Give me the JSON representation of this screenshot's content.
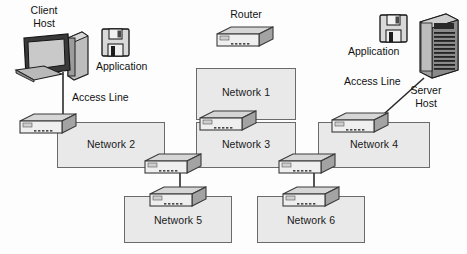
{
  "diagram": {
    "colors": {
      "box_fill": "#e9e9e9",
      "box_border": "#6a6a6a",
      "device_top": "#d6d6d6",
      "device_front": "#ededed",
      "device_side": "#a8a8a8",
      "line": "#2b2b2b",
      "text": "#111111"
    },
    "labels": {
      "client_host": "Client\nHost",
      "client_host_line1": "Client",
      "client_host_line2": "Host",
      "server_host_line1": "Server",
      "server_host_line2": "Host",
      "router": "Router",
      "application_left": "Application",
      "application_right": "Application",
      "access_line_left": "Access Line",
      "access_line_right": "Access Line"
    },
    "networks": [
      {
        "id": "network-1",
        "label": "Network 1",
        "x": 196,
        "y": 68,
        "w": 100,
        "h": 52
      },
      {
        "id": "network-2",
        "label": "Network 2",
        "x": 57,
        "y": 122,
        "w": 108,
        "h": 46
      },
      {
        "id": "network-3",
        "label": "Network 3",
        "x": 196,
        "y": 122,
        "w": 100,
        "h": 46
      },
      {
        "id": "network-4",
        "label": "Network 4",
        "x": 318,
        "y": 122,
        "w": 112,
        "h": 46
      },
      {
        "id": "network-5",
        "label": "Network 5",
        "x": 124,
        "y": 196,
        "w": 108,
        "h": 47
      },
      {
        "id": "network-6",
        "label": "Network 6",
        "x": 257,
        "y": 196,
        "w": 108,
        "h": 47
      }
    ],
    "devices": [
      {
        "id": "router-legend",
        "name": "router-icon-legend",
        "x": 215,
        "y": 26
      },
      {
        "id": "switch-net2",
        "name": "switch-network-2",
        "x": 18,
        "y": 113
      },
      {
        "id": "switch-net1-3",
        "name": "switch-network-1-3",
        "x": 198,
        "y": 110
      },
      {
        "id": "switch-net4",
        "name": "switch-network-4",
        "x": 330,
        "y": 112
      },
      {
        "id": "switch-mid-l",
        "name": "switch-network-2-3",
        "x": 143,
        "y": 153
      },
      {
        "id": "switch-mid-r",
        "name": "switch-network-3-4",
        "x": 277,
        "y": 153
      },
      {
        "id": "switch-net5",
        "name": "switch-network-5",
        "x": 148,
        "y": 186
      },
      {
        "id": "switch-net6",
        "name": "switch-network-6",
        "x": 281,
        "y": 186
      }
    ],
    "icons": {
      "client_pc": "desktop-computer-icon",
      "server_tower": "server-tower-icon",
      "floppy_left": "floppy-disk-icon",
      "floppy_right": "floppy-disk-icon",
      "router": "router-icon"
    }
  }
}
